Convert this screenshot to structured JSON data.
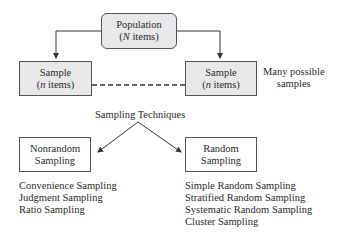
{
  "population": {
    "title": "Population",
    "subtitle_var": "N",
    "subtitle_rest": " items"
  },
  "sample_left": {
    "title": "Sample",
    "subtitle_var": "n",
    "subtitle_rest": " items"
  },
  "sample_right": {
    "title": "Sample",
    "subtitle_var": "n",
    "subtitle_rest": " items"
  },
  "many_samples": {
    "line1": "Many possible",
    "line2": "samples"
  },
  "techniques_label": "Sampling Techniques",
  "nonrandom": {
    "line1": "Nonrandom",
    "line2": "Sampling",
    "items": [
      "Convenience Sampling",
      "Judgment Sampling",
      "Ratio Sampling"
    ]
  },
  "random": {
    "line1": "Random",
    "line2": "Sampling",
    "items": [
      "Simple Random Sampling",
      "Stratified Random Sampling",
      "Systematic Random Sampling",
      "Cluster Sampling"
    ]
  }
}
